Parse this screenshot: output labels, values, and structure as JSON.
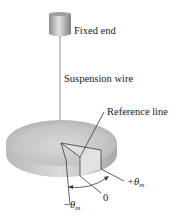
{
  "labels": {
    "fixed_end": "Fixed end",
    "suspension_wire": "Suspension wire",
    "reference_line": "Reference line",
    "plus_theta": "+θ",
    "minus_theta": "−θ",
    "zero": "0",
    "subscript_m": "m"
  },
  "colors": {
    "disk_top": "#c9c9c9",
    "disk_edge": "#b5b5b5",
    "wire": "#8a8a8a",
    "lines": "#3a3a3a"
  }
}
